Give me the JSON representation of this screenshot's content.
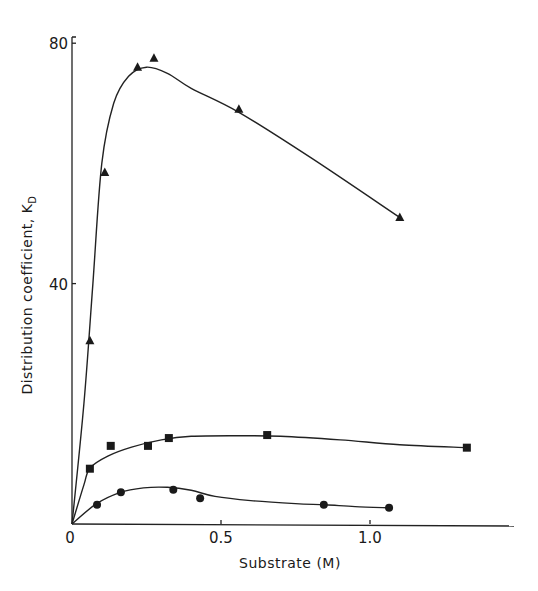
{
  "chart_data": {
    "type": "line",
    "title": "",
    "xlabel": "Substrate (M)",
    "ylabel": "Distribution coefficient, K",
    "ylabel_subscript": "D",
    "xlim": [
      0,
      1.45
    ],
    "ylim": [
      0,
      85
    ],
    "x_ticks": [
      {
        "value": 0,
        "label": "0"
      },
      {
        "value": 0.5,
        "label": "0.5"
      },
      {
        "value": 1.0,
        "label": "1.0"
      }
    ],
    "y_ticks": [
      {
        "value": 40,
        "label": "40"
      },
      {
        "value": 80,
        "label": "80"
      }
    ],
    "grid": false,
    "legend": null,
    "series": [
      {
        "name": "triangles",
        "marker": "triangle",
        "points": [
          {
            "x": 0.06,
            "y": 30.5
          },
          {
            "x": 0.11,
            "y": 58.5
          },
          {
            "x": 0.22,
            "y": 76
          },
          {
            "x": 0.275,
            "y": 77.5
          },
          {
            "x": 0.56,
            "y": 69
          },
          {
            "x": 1.1,
            "y": 51
          }
        ],
        "curve": [
          [
            0,
            0
          ],
          [
            0.04,
            20
          ],
          [
            0.07,
            40
          ],
          [
            0.1,
            60
          ],
          [
            0.14,
            70
          ],
          [
            0.19,
            74.5
          ],
          [
            0.25,
            76
          ],
          [
            0.32,
            75
          ],
          [
            0.4,
            72.5
          ],
          [
            0.56,
            68.5
          ],
          [
            0.8,
            61
          ],
          [
            1.1,
            51
          ]
        ]
      },
      {
        "name": "squares",
        "marker": "square",
        "points": [
          {
            "x": 0.06,
            "y": 9.2
          },
          {
            "x": 0.13,
            "y": 13
          },
          {
            "x": 0.255,
            "y": 13
          },
          {
            "x": 0.325,
            "y": 14.3
          },
          {
            "x": 0.655,
            "y": 14.8
          },
          {
            "x": 1.325,
            "y": 12.7
          }
        ],
        "curve": [
          [
            0,
            0
          ],
          [
            0.04,
            6.5
          ],
          [
            0.06,
            9.3
          ],
          [
            0.12,
            11.3
          ],
          [
            0.2,
            12.8
          ],
          [
            0.3,
            14
          ],
          [
            0.4,
            14.6
          ],
          [
            0.55,
            14.7
          ],
          [
            0.7,
            14.6
          ],
          [
            0.9,
            14.0
          ],
          [
            1.1,
            13.2
          ],
          [
            1.325,
            12.7
          ]
        ]
      },
      {
        "name": "circles",
        "marker": "circle",
        "points": [
          {
            "x": 0.084,
            "y": 3.2
          },
          {
            "x": 0.164,
            "y": 5.3
          },
          {
            "x": 0.34,
            "y": 5.7
          },
          {
            "x": 0.43,
            "y": 4.3
          },
          {
            "x": 0.845,
            "y": 3.2
          },
          {
            "x": 1.064,
            "y": 2.7
          }
        ],
        "curve": [
          [
            0,
            0
          ],
          [
            0.08,
            3.3
          ],
          [
            0.16,
            5.2
          ],
          [
            0.24,
            6.0
          ],
          [
            0.32,
            6.1
          ],
          [
            0.4,
            5.6
          ],
          [
            0.48,
            4.6
          ],
          [
            0.6,
            3.9
          ],
          [
            0.75,
            3.4
          ],
          [
            0.85,
            3.2
          ],
          [
            0.95,
            2.9
          ],
          [
            1.064,
            2.7
          ]
        ]
      }
    ]
  }
}
